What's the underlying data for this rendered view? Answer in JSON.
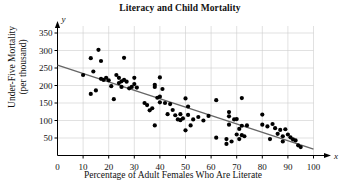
{
  "chart_data": {
    "type": "scatter",
    "title": "Literacy and Child Mortality",
    "xlabel": "Percentage of Adult Females Who Are Literate",
    "ylabel_line1": "Under-Five Mortality",
    "ylabel_line2": "(per thousand)",
    "x_axis_symbol": "x",
    "y_axis_symbol": "y",
    "xlim": [
      0,
      100
    ],
    "ylim": [
      0,
      370
    ],
    "xticks": [
      0,
      10,
      20,
      30,
      40,
      50,
      60,
      70,
      80,
      90,
      100
    ],
    "yticks": [
      50,
      100,
      150,
      200,
      250,
      300,
      350
    ],
    "grid": true,
    "grid_color": "#cccccc",
    "point_color": "#000000",
    "trendline_color": "#666666",
    "trendline": {
      "label": "least-squares regression line",
      "x_start": 0,
      "y_start": 258,
      "x_end": 100,
      "y_end": 18
    },
    "points": [
      [
        10,
        230
      ],
      [
        13,
        278
      ],
      [
        13,
        176
      ],
      [
        14,
        240
      ],
      [
        15,
        186
      ],
      [
        16,
        302
      ],
      [
        17,
        270
      ],
      [
        17,
        219
      ],
      [
        18,
        216
      ],
      [
        19,
        222
      ],
      [
        20,
        215
      ],
      [
        21,
        198
      ],
      [
        22,
        161
      ],
      [
        23,
        230
      ],
      [
        24,
        222
      ],
      [
        24,
        207
      ],
      [
        25,
        212
      ],
      [
        25,
        196
      ],
      [
        26,
        279
      ],
      [
        26,
        216
      ],
      [
        27,
        211
      ],
      [
        28,
        192
      ],
      [
        29,
        196
      ],
      [
        30,
        222
      ],
      [
        30,
        204
      ],
      [
        31,
        194
      ],
      [
        34,
        150
      ],
      [
        35,
        144
      ],
      [
        36,
        129
      ],
      [
        37,
        135
      ],
      [
        38,
        202
      ],
      [
        38,
        196
      ],
      [
        38,
        86
      ],
      [
        39,
        165
      ],
      [
        40,
        223
      ],
      [
        40,
        168
      ],
      [
        40,
        152
      ],
      [
        41,
        190
      ],
      [
        42,
        150
      ],
      [
        43,
        118
      ],
      [
        44,
        147
      ],
      [
        45,
        130
      ],
      [
        46,
        115
      ],
      [
        47,
        103
      ],
      [
        48,
        101
      ],
      [
        48,
        118
      ],
      [
        49,
        106
      ],
      [
        50,
        163
      ],
      [
        50,
        72
      ],
      [
        51,
        140
      ],
      [
        51,
        116
      ],
      [
        52,
        86
      ],
      [
        53,
        103
      ],
      [
        55,
        110
      ],
      [
        57,
        100
      ],
      [
        59,
        113
      ],
      [
        62,
        158
      ],
      [
        62,
        51
      ],
      [
        66,
        33
      ],
      [
        66,
        47
      ],
      [
        67,
        124
      ],
      [
        67,
        112
      ],
      [
        67,
        88
      ],
      [
        68,
        40
      ],
      [
        69,
        103
      ],
      [
        70,
        104
      ],
      [
        70,
        60
      ],
      [
        71,
        76
      ],
      [
        71,
        47
      ],
      [
        72,
        164
      ],
      [
        72,
        85
      ],
      [
        72,
        58
      ],
      [
        73,
        55
      ],
      [
        74,
        86
      ],
      [
        80,
        117
      ],
      [
        80,
        88
      ],
      [
        82,
        83
      ],
      [
        83,
        47
      ],
      [
        84,
        90
      ],
      [
        85,
        78
      ],
      [
        86,
        62
      ],
      [
        87,
        73
      ],
      [
        88,
        55
      ],
      [
        88,
        40
      ],
      [
        89,
        75
      ],
      [
        90,
        60
      ],
      [
        91,
        52
      ],
      [
        92,
        46
      ],
      [
        93,
        43
      ],
      [
        94,
        29
      ],
      [
        95,
        24
      ]
    ]
  }
}
